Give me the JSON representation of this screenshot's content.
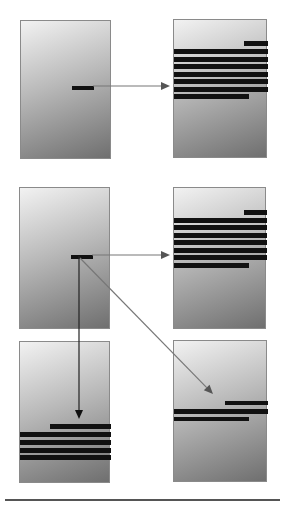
{
  "diagram": {
    "colors": {
      "panel_border": "#8a8a8a",
      "gradient_light": "#f2f2f2",
      "gradient_mid": "#b9b9b9",
      "gradient_dark": "#6f6f6f",
      "bar": "#111111",
      "arrow_dark": "#222222",
      "arrow_gray": "#777777",
      "rule": "#555555"
    },
    "panels": [
      {
        "id": "A",
        "x": 20,
        "y": 20,
        "w": 91,
        "h": 139,
        "bars": [
          {
            "x": 51,
            "y": 65,
            "w": 22,
            "h": 4
          }
        ]
      },
      {
        "id": "B",
        "x": 173,
        "y": 19,
        "w": 94,
        "h": 139,
        "bars": [
          {
            "x": 70,
            "y": 21,
            "w": 24,
            "h": 5
          },
          {
            "x": 0,
            "y": 29,
            "w": 94,
            "h": 5
          },
          {
            "x": 0,
            "y": 37,
            "w": 94,
            "h": 5
          },
          {
            "x": 0,
            "y": 44,
            "w": 94,
            "h": 5
          },
          {
            "x": 0,
            "y": 52,
            "w": 94,
            "h": 5
          },
          {
            "x": 0,
            "y": 59,
            "w": 94,
            "h": 5
          },
          {
            "x": 0,
            "y": 67,
            "w": 94,
            "h": 5
          },
          {
            "x": 0,
            "y": 74,
            "w": 75,
            "h": 5
          }
        ]
      },
      {
        "id": "C",
        "x": 19,
        "y": 187,
        "w": 91,
        "h": 142,
        "bars": [
          {
            "x": 51,
            "y": 67,
            "w": 22,
            "h": 4
          }
        ]
      },
      {
        "id": "D",
        "x": 173,
        "y": 187,
        "w": 93,
        "h": 142,
        "bars": [
          {
            "x": 70,
            "y": 22,
            "w": 23,
            "h": 5
          },
          {
            "x": 0,
            "y": 30,
            "w": 93,
            "h": 5
          },
          {
            "x": 0,
            "y": 37,
            "w": 93,
            "h": 5
          },
          {
            "x": 0,
            "y": 45,
            "w": 93,
            "h": 5
          },
          {
            "x": 0,
            "y": 52,
            "w": 93,
            "h": 5
          },
          {
            "x": 0,
            "y": 60,
            "w": 93,
            "h": 5
          },
          {
            "x": 0,
            "y": 67,
            "w": 93,
            "h": 5
          },
          {
            "x": 0,
            "y": 75,
            "w": 75,
            "h": 5
          }
        ]
      },
      {
        "id": "E",
        "x": 19,
        "y": 341,
        "w": 91,
        "h": 142,
        "bars": [
          {
            "x": 30,
            "y": 82,
            "w": 61,
            "h": 5
          },
          {
            "x": 0,
            "y": 90,
            "w": 91,
            "h": 5
          },
          {
            "x": 0,
            "y": 98,
            "w": 91,
            "h": 5
          },
          {
            "x": 0,
            "y": 106,
            "w": 91,
            "h": 5
          },
          {
            "x": 0,
            "y": 113,
            "w": 91,
            "h": 5
          }
        ]
      },
      {
        "id": "F",
        "x": 173,
        "y": 340,
        "w": 94,
        "h": 142,
        "bars": [
          {
            "x": 51,
            "y": 60,
            "w": 43,
            "h": 4
          },
          {
            "x": 0,
            "y": 68,
            "w": 94,
            "h": 5
          },
          {
            "x": 0,
            "y": 76,
            "w": 75,
            "h": 4
          }
        ]
      }
    ],
    "arrows": [
      {
        "from": "A",
        "to": "B",
        "x1": 93,
        "y1": 86,
        "x2": 170,
        "y2": 86,
        "color": "#777777"
      },
      {
        "from": "C",
        "to": "D",
        "x1": 92,
        "y1": 255,
        "x2": 170,
        "y2": 255,
        "color": "#777777"
      },
      {
        "from": "C",
        "to": "E",
        "x1": 79,
        "y1": 256,
        "x2": 79,
        "y2": 419,
        "color": "#222222"
      },
      {
        "from": "C",
        "to": "F",
        "x1": 80,
        "y1": 258,
        "x2": 213,
        "y2": 394,
        "color": "#777777"
      }
    ],
    "rule": {
      "x": 5,
      "y": 499,
      "w": 275
    }
  }
}
